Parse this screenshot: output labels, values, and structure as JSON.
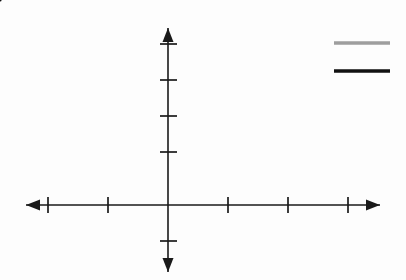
{
  "figure": {
    "title": "",
    "axis_labels": {
      "x": "x",
      "y": "y"
    },
    "colors": {
      "axis": "#1a1a1a",
      "curve_parabola": "#9a9a9a",
      "curve_line": "#111111",
      "shaded_region": "#d2d2d2",
      "background": "#fdfdfd",
      "text": "#151515"
    }
  },
  "legend": {
    "entries": [
      {
        "label": "(x − 1)2 − 1",
        "label_parts": {
          "lead": "(",
          "var1": "x",
          "mid": " − 1)",
          "exp": "2",
          "tail": " − 1"
        },
        "color": "#9a9a9a",
        "style": "solid",
        "width": 3
      },
      {
        "label": "−x + 2",
        "label_parts": {
          "lead": "−",
          "var1": "x",
          "tail": " + 2"
        },
        "color": "#111111",
        "style": "solid",
        "width": 3
      }
    ]
  },
  "axes": {
    "x": {
      "label": "x",
      "ticks": [
        {
          "value": -2,
          "label": "-2",
          "show_label": true
        },
        {
          "value": -1,
          "label": "-1",
          "show_label": true
        },
        {
          "value": 1,
          "label": "1",
          "show_label": false
        },
        {
          "value": 2,
          "label": "2",
          "show_label": true
        },
        {
          "value": 3,
          "label": "3",
          "show_label": false
        }
      ],
      "range": [
        -2.6,
        3.6
      ],
      "arrows": "both"
    },
    "y": {
      "label": "y",
      "ticks": [
        {
          "value": 10,
          "label": "10",
          "show_label": true
        },
        {
          "value": 8,
          "label": "8",
          "show_label": true
        },
        {
          "value": 6,
          "label": "6",
          "show_label": true
        },
        {
          "value": 4,
          "label": "4",
          "show_label": true
        },
        {
          "value": -2,
          "label": "-2",
          "show_label": false
        }
      ],
      "range": [
        -4.2,
        11.5
      ],
      "arrows": "both"
    }
  },
  "chart_data": {
    "type": "line",
    "title": "",
    "xlabel": "x",
    "ylabel": "y",
    "xlim": [
      -2.6,
      3.6
    ],
    "ylim": [
      -4.2,
      11.5
    ],
    "grid": false,
    "legend_position": "top-right",
    "series": [
      {
        "name": "(x − 1)2 − 1",
        "expression": "(x-1)^2 - 1",
        "color": "#9a9a9a",
        "x": [
          -2.0,
          -1.75,
          -1.5,
          -1.25,
          -1.0,
          -0.75,
          -0.5,
          -0.25,
          0.0,
          0.25,
          0.5,
          0.75,
          1.0,
          1.25,
          1.5,
          1.75,
          2.0,
          2.25,
          2.5,
          2.75,
          3.0
        ],
        "values": [
          8.0,
          6.5625,
          5.25,
          4.0625,
          3.0,
          2.0625,
          1.25,
          0.5625,
          0.0,
          -0.4375,
          -0.75,
          -0.9375,
          -1.0,
          -0.9375,
          -0.75,
          -0.4375,
          0.0,
          0.5625,
          1.25,
          2.0625,
          3.0
        ]
      },
      {
        "name": "−x + 2",
        "expression": "-x + 2",
        "color": "#111111",
        "x": [
          -2.0,
          3.2
        ],
        "values": [
          4.0,
          -1.2
        ]
      }
    ],
    "shaded_region": {
      "label": "region between curves",
      "color": "#d2d2d2",
      "x_from": 0,
      "x_to": 2,
      "upper_curve": "−x + 2",
      "lower_curve": "(x − 1)2 − 1"
    },
    "intersections": [
      {
        "x": -1,
        "y": 3
      },
      {
        "x": 2,
        "y": 0
      }
    ]
  }
}
